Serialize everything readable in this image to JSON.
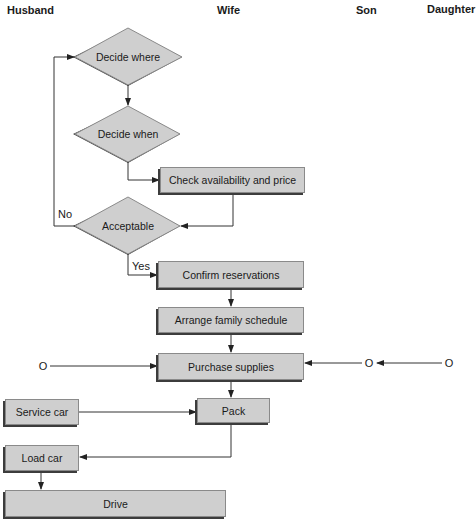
{
  "lanes": [
    {
      "label": "Husband"
    },
    {
      "label": "Wife"
    },
    {
      "label": "Son"
    },
    {
      "label": "Daughter"
    }
  ],
  "decisions": {
    "decide_where": "Decide where",
    "decide_when": "Decide when",
    "acceptable": "Acceptable"
  },
  "processes": {
    "check_availability": "Check availability and price",
    "confirm_reservations": "Confirm reservations",
    "arrange_schedule": "Arrange family schedule",
    "purchase_supplies": "Purchase supplies",
    "pack": "Pack",
    "service_car": "Service car",
    "load_car": "Load car",
    "drive": "Drive"
  },
  "edge_labels": {
    "no": "No",
    "yes": "Yes"
  },
  "terminals": {
    "husband": "O",
    "son": "O",
    "daughter": "O"
  },
  "colors": {
    "fill": "#cfcfcf",
    "shadow": "#3c3c3c",
    "line": "#333333"
  }
}
